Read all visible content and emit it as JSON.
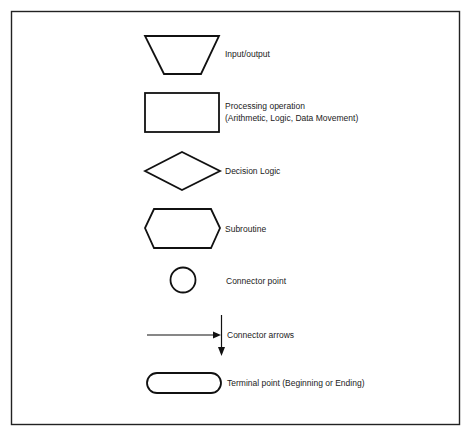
{
  "legend": {
    "title": "",
    "items": [
      {
        "symbol": "trapezoid",
        "label": "Input/output"
      },
      {
        "symbol": "rectangle",
        "label": "Processing operation",
        "label2": "(Arithmetic, Logic, Data Movement)"
      },
      {
        "symbol": "diamond",
        "label": "Decision Logic"
      },
      {
        "symbol": "hexagon",
        "label": "Subroutine"
      },
      {
        "symbol": "circle",
        "label": "Connector point"
      },
      {
        "symbol": "arrows",
        "label": "Connector arrows"
      },
      {
        "symbol": "rounded-rectangle",
        "label": "Terminal point (Beginning or Ending)"
      }
    ]
  },
  "colors": {
    "stroke": "#111111",
    "background": "#ffffff",
    "text": "#222222"
  }
}
